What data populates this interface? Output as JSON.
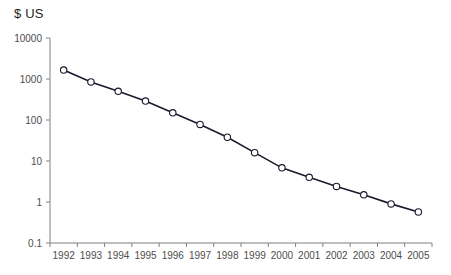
{
  "chart_data": {
    "type": "line",
    "title": "$ US",
    "xlabel": "",
    "ylabel": "$ US",
    "yscale": "log",
    "ylim": [
      0.1,
      10000
    ],
    "grid": false,
    "legend": null,
    "marker": "open-circle",
    "line_color": "#1a1a2e",
    "marker_face_color": "#ffffff",
    "axis_color": "#808080",
    "categories": [
      "1992",
      "1993",
      "1994",
      "1995",
      "1996",
      "1997",
      "1998",
      "1999",
      "2000",
      "2001",
      "2002",
      "2003",
      "2004",
      "2005"
    ],
    "values": [
      1650,
      850,
      500,
      290,
      150,
      78,
      38,
      16,
      6.8,
      4.0,
      2.4,
      1.5,
      0.9,
      0.57
    ],
    "ytick_labels": [
      "10000",
      "1000",
      "100",
      "10",
      "1",
      "0.1"
    ],
    "ytick_values": [
      10000,
      1000,
      100,
      10,
      1,
      0.1
    ],
    "xtick_labels": [
      "1992",
      "1993",
      "1994",
      "1995",
      "1996",
      "1997",
      "1998",
      "1999",
      "2000",
      "2001",
      "2002",
      "2003",
      "2004",
      "2005"
    ]
  },
  "colors": {
    "line": "#1a1a2e",
    "axis": "#808080",
    "text": "#4d4d4d",
    "title": "#231f20",
    "background": "#ffffff"
  }
}
